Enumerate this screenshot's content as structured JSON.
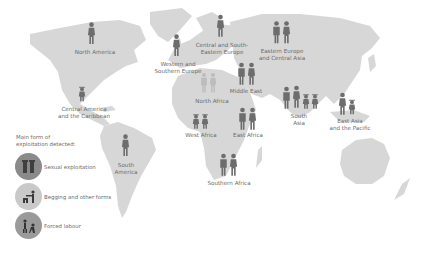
{
  "colors": {
    "land": "#d7d7d7",
    "figure_dark": "#6d6d6d",
    "figure_faint": "#bdbdbd",
    "text": "#6b6b6b",
    "legend_sexual": "#8a8a8a",
    "legend_begging": "#c9c9c9",
    "legend_forced": "#9a9a9a"
  },
  "regions": [
    {
      "name": "North America",
      "label": "North America"
    },
    {
      "name": "Central America and the Caribbean",
      "label_line1": "Central America",
      "label_line2": "and the Caribbean"
    },
    {
      "name": "South America",
      "label_line1": "South",
      "label_line2": "America"
    },
    {
      "name": "Western and Southern Europe",
      "label_line1": "Western and",
      "label_line2": "Southern Europe"
    },
    {
      "name": "Central and South-Eastern Europe",
      "label_line1": "Central and South-",
      "label_line2": "Eastern Europe"
    },
    {
      "name": "Eastern Europe and Central Asia",
      "label_line1": "Eastern Europe",
      "label_line2": "and Central Asia"
    },
    {
      "name": "North Africa",
      "label": "North Africa"
    },
    {
      "name": "Middle East",
      "label": "Middle East"
    },
    {
      "name": "West Africa",
      "label": "West Africa"
    },
    {
      "name": "East Africa",
      "label": "East Africa"
    },
    {
      "name": "Southern Africa",
      "label": "Southern Africa"
    },
    {
      "name": "South Asia",
      "label_line1": "South",
      "label_line2": "Asia"
    },
    {
      "name": "East Asia and the Pacific",
      "label_line1": "East Asia",
      "label_line2": "and the Pacific"
    }
  ],
  "legend": {
    "title_line1": "Main form of",
    "title_line2": "exploitation detected:",
    "items": [
      {
        "label": "Sexual exploitation",
        "icon": "sexual-exploitation-icon"
      },
      {
        "label": "Begging and other forms",
        "icon": "begging-icon"
      },
      {
        "label": "Forced labour",
        "icon": "forced-labour-icon"
      }
    ]
  }
}
